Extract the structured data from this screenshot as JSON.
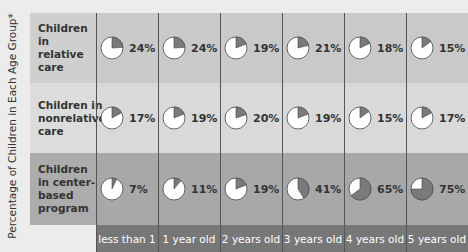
{
  "chart_data": {
    "type": "pie",
    "title": "",
    "ylabel": "Percentage of Children in Each Age Group*",
    "categories": [
      "less than 1",
      "1 year old",
      "2 years old",
      "3 years old",
      "4 years old",
      "5 years old"
    ],
    "series": [
      {
        "name": "Children in relative care",
        "values": [
          24,
          24,
          19,
          21,
          18,
          15
        ]
      },
      {
        "name": "Children in nonrelative care",
        "values": [
          17,
          19,
          20,
          19,
          15,
          17
        ]
      },
      {
        "name": "Children in center-based program",
        "values": [
          7,
          11,
          19,
          41,
          65,
          75
        ]
      }
    ],
    "colors": {
      "slice": "#7a7a7a",
      "remainder": "#ffffff"
    }
  },
  "ylabel": "Percentage of Children in Each Age Group*",
  "rows": [
    {
      "label": "Children in relative care",
      "cells": [
        "24%",
        "24%",
        "19%",
        "21%",
        "18%",
        "15%"
      ]
    },
    {
      "label": "Children in nonrelative care",
      "cells": [
        "17%",
        "19%",
        "20%",
        "19%",
        "15%",
        "17%"
      ]
    },
    {
      "label": "Children in center-based program",
      "cells": [
        "7%",
        "11%",
        "19%",
        "41%",
        "65%",
        "75%"
      ]
    }
  ],
  "columns": [
    "less than 1",
    "1 year old",
    "2 years old",
    "3 years old",
    "4 years old",
    "5 years old"
  ]
}
